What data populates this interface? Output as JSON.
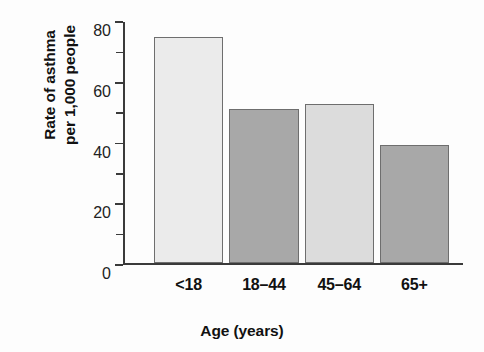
{
  "chart_data": {
    "type": "bar",
    "title": "",
    "subtitle": "",
    "xlabel": "Age (years)",
    "ylabel_line1": "Rate of asthma",
    "ylabel_line2": "per 1,000 people",
    "categories": [
      "<18",
      "18–44",
      "45–64",
      "65+"
    ],
    "values": [
      74.5,
      51,
      52.5,
      39
    ],
    "series": [
      {
        "name": "Rate of asthma per 1,000 people",
        "values": [
          74.5,
          51,
          52.5,
          39
        ]
      }
    ],
    "ylim": [
      0,
      80
    ],
    "xlim": [
      0,
      4
    ],
    "y_major_ticks": [
      0,
      20,
      40,
      60,
      80
    ],
    "y_major_tick_labels": [
      "0",
      "20",
      "40",
      "60",
      "80"
    ],
    "y_minor_ticks": [
      10,
      30,
      50,
      70
    ],
    "grid": false,
    "legend": null,
    "legend_position": "none",
    "annotations": [],
    "bar_colors": [
      "#ebebeb",
      "#a8a8a8",
      "#dcdcdc",
      "#a8a8a8"
    ],
    "bar_edge_color": "#6e6e6e",
    "axis_color": "#3a3a3a",
    "background_color": "#fdfdfd"
  }
}
